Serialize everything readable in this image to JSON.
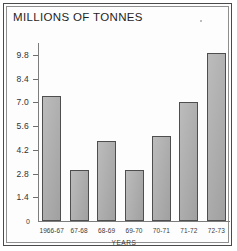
{
  "chart_data": {
    "type": "bar",
    "title": "MILLIONS OF TONNES",
    "xlabel": "YEARS",
    "ylabel": "",
    "categories": [
      "1966-67",
      "67-68",
      "68-69",
      "69-70",
      "70-71",
      "71-72",
      "72-73"
    ],
    "values": [
      7.4,
      3.0,
      4.7,
      3.0,
      5.0,
      7.0,
      9.9
    ],
    "ytick_labels": [
      "9.8",
      "8.4",
      "7.0",
      "5.6",
      "4.2",
      "2.8",
      "1.4",
      "0"
    ],
    "ytick_values": [
      9.8,
      8.4,
      7.0,
      5.6,
      4.2,
      2.8,
      1.4,
      0
    ],
    "ylim": [
      0,
      10.5
    ],
    "grid": false,
    "legend": "none",
    "bar_color": "#a9a9a9",
    "bar_border_color": "#4e4e4e",
    "axis_color": "#7d7d7d",
    "frame_color": "#4a4a4a"
  },
  "zero_label": "0"
}
